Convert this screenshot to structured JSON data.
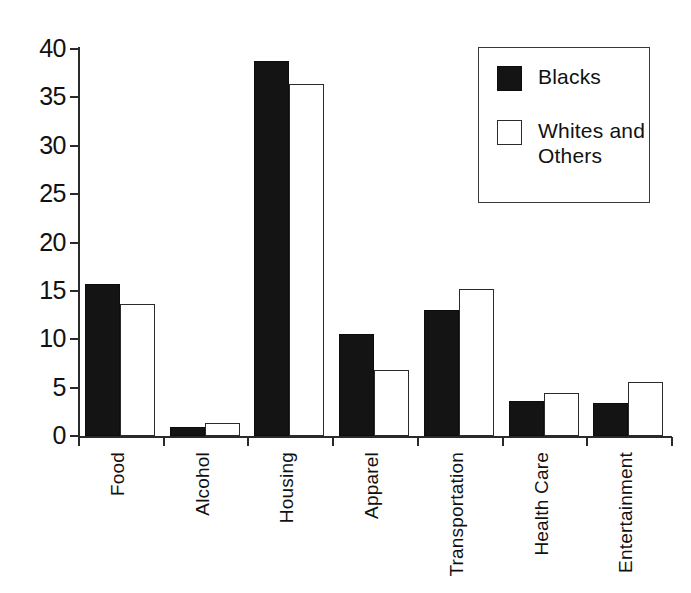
{
  "chart_data": {
    "type": "bar",
    "title": "",
    "subtitle": "",
    "xlabel": "",
    "ylabel": "",
    "ylim": [
      0,
      40
    ],
    "y_ticks": [
      0,
      5,
      10,
      15,
      20,
      25,
      30,
      35,
      40
    ],
    "y_tick_labels": [
      "0",
      "5",
      "10",
      "15",
      "20",
      "25",
      "30",
      "35",
      "40"
    ],
    "grid": false,
    "legend_position": "top-right",
    "categories": [
      "Food",
      "Alcohol",
      "Housing",
      "Apparel",
      "Transportation",
      "Health Care",
      "Entertainment"
    ],
    "series": [
      {
        "name": "Blacks",
        "color": "#141414",
        "fill": "solid",
        "values": [
          15.7,
          0.9,
          38.8,
          10.5,
          13.0,
          3.6,
          3.4
        ]
      },
      {
        "name": "Whites and Others",
        "color": "#ffffff",
        "fill": "open",
        "values": [
          13.6,
          1.3,
          36.4,
          6.8,
          15.2,
          4.4,
          5.6
        ]
      }
    ]
  },
  "legend": {
    "entries": [
      {
        "label": "Blacks",
        "swatch": "filled-square-icon"
      },
      {
        "label": "Whites and\nOthers",
        "swatch": "open-square-icon"
      }
    ]
  }
}
